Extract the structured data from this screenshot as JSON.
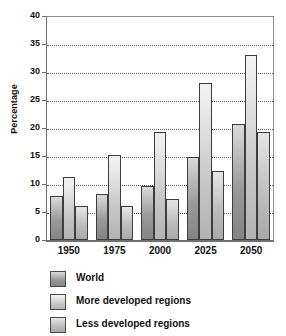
{
  "chart_data": {
    "type": "bar",
    "title": "",
    "xlabel": "",
    "ylabel": "Percentage",
    "categories": [
      "1950",
      "1975",
      "2000",
      "2025",
      "2050"
    ],
    "series": [
      {
        "name": "World",
        "values": [
          7.9,
          8.2,
          9.7,
          14.8,
          20.8
        ],
        "color": "#9a9a9a"
      },
      {
        "name": "More developed regions",
        "values": [
          11.3,
          15.2,
          19.2,
          28.1,
          33.0
        ],
        "color": "#ededed"
      },
      {
        "name": "Less developed regions",
        "values": [
          6.0,
          6.0,
          7.4,
          12.3,
          19.2
        ],
        "color": "#cccccc"
      }
    ],
    "ylim": [
      0,
      40
    ],
    "yticks": [
      0,
      5,
      10,
      15,
      20,
      25,
      30,
      35,
      40
    ],
    "ytick_labels": [
      "0",
      "5",
      "10",
      "15",
      "20",
      "25",
      "30",
      "35",
      "40"
    ],
    "grid": true,
    "grid_style": "dotted-horizontal",
    "legend_position": "bottom-left",
    "orientation": "vertical",
    "bar_style": "grouped"
  },
  "legend": {
    "items": [
      {
        "label": "World"
      },
      {
        "label": "More developed regions"
      },
      {
        "label": "Less developed regions"
      }
    ]
  }
}
